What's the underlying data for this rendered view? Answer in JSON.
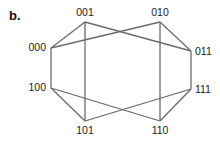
{
  "panel_label": "b.",
  "colors": {
    "edge": "#6a6a6a",
    "text": "#222222",
    "background": "#ffffff"
  },
  "nodes": [
    {
      "id": "000",
      "label": "000",
      "x": 51,
      "y": 48,
      "lx": 46,
      "ly": 51,
      "anchor": "end"
    },
    {
      "id": "001",
      "label": "001",
      "x": 85,
      "y": 22,
      "lx": 85,
      "ly": 16,
      "anchor": "middle"
    },
    {
      "id": "010",
      "label": "010",
      "x": 160,
      "y": 22,
      "lx": 160,
      "ly": 16,
      "anchor": "middle"
    },
    {
      "id": "011",
      "label": "011",
      "x": 191,
      "y": 51,
      "lx": 195,
      "ly": 55,
      "anchor": "start"
    },
    {
      "id": "100",
      "label": "100",
      "x": 51,
      "y": 88,
      "lx": 46,
      "ly": 91,
      "anchor": "end"
    },
    {
      "id": "101",
      "label": "101",
      "x": 85,
      "y": 121,
      "lx": 85,
      "ly": 134,
      "anchor": "middle"
    },
    {
      "id": "110",
      "label": "110",
      "x": 160,
      "y": 121,
      "lx": 160,
      "ly": 134,
      "anchor": "middle"
    },
    {
      "id": "111",
      "label": "111",
      "x": 191,
      "y": 89,
      "lx": 195,
      "ly": 93,
      "anchor": "start"
    }
  ],
  "edges": [
    [
      "000",
      "001"
    ],
    [
      "000",
      "010"
    ],
    [
      "001",
      "011"
    ],
    [
      "010",
      "011"
    ],
    [
      "000",
      "100"
    ],
    [
      "001",
      "101"
    ],
    [
      "010",
      "110"
    ],
    [
      "011",
      "111"
    ],
    [
      "100",
      "101"
    ],
    [
      "100",
      "110"
    ],
    [
      "101",
      "111"
    ],
    [
      "110",
      "111"
    ]
  ]
}
